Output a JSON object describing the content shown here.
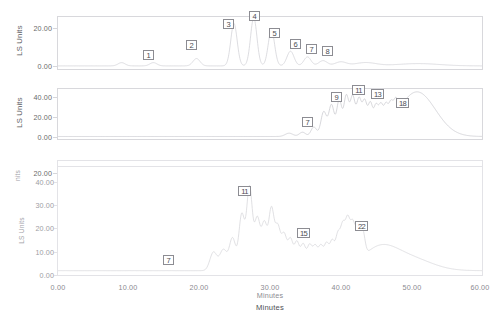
{
  "figure": {
    "axis": {
      "x_label": "Minutes",
      "x_label_lower": "Minutes",
      "x_ticks": [
        "0.00",
        "10.00",
        "20.00",
        "30.00",
        "40.00",
        "50.00",
        "60.00"
      ],
      "x_min": 0,
      "x_max": 60
    },
    "panels": [
      {
        "id": "panel-1",
        "y_label": "LS Units",
        "y_ticks": [
          "20.00",
          "0.00"
        ],
        "y_values": [
          20,
          0
        ],
        "peak_labels": [
          "1",
          "2",
          "3",
          "4",
          "5",
          "6",
          "7",
          "8"
        ]
      },
      {
        "id": "panel-2",
        "y_label": "LS Units",
        "y_ticks": [
          "40.00",
          "20.00",
          "0.00"
        ],
        "y_values": [
          40,
          20,
          0
        ],
        "peak_labels": [
          "7",
          "9",
          "11",
          "13",
          "18"
        ]
      },
      {
        "id": "panel-3",
        "y_label_top": "nits",
        "y_label": "LS Units",
        "y_ticks_top": [
          "20.00"
        ],
        "y_ticks": [
          "40.00",
          "30.00",
          "20.00",
          "10.00",
          "0.00"
        ],
        "y_values": [
          40,
          30,
          20,
          10,
          0
        ],
        "peak_labels": [
          "7",
          "11",
          "15",
          "22"
        ]
      }
    ]
  },
  "chart_data": {
    "type": "line",
    "title": "",
    "xlabel": "Minutes",
    "ylabel": "LS Units",
    "xlim": [
      0,
      60
    ],
    "grid": false,
    "legend": "none",
    "panels": [
      {
        "name": "panel-1",
        "ylabel": "LS Units",
        "ylim": [
          0,
          30
        ],
        "yticks": [
          0,
          20
        ],
        "annotations": [
          {
            "label": "1",
            "x": 13.5,
            "y": 5.5
          },
          {
            "label": "2",
            "x": 19.5,
            "y": 12.5
          },
          {
            "label": "3",
            "x": 25.0,
            "y": 25.5
          },
          {
            "label": "4",
            "x": 27.7,
            "y": 29.0
          },
          {
            "label": "5",
            "x": 30.2,
            "y": 22.5
          },
          {
            "label": "6",
            "x": 33.2,
            "y": 15.5
          },
          {
            "label": "7",
            "x": 35.4,
            "y": 13.0
          },
          {
            "label": "8",
            "x": 37.6,
            "y": 12.0
          }
        ],
        "peaks": [
          {
            "x": 9.0,
            "height": 2.0,
            "width": 0.5
          },
          {
            "x": 13.5,
            "height": 2.0,
            "width": 0.5
          },
          {
            "x": 19.6,
            "height": 4.5,
            "width": 0.5
          },
          {
            "x": 24.9,
            "height": 26.0,
            "width": 0.45
          },
          {
            "x": 27.7,
            "height": 29.5,
            "width": 0.45
          },
          {
            "x": 30.2,
            "height": 22.0,
            "width": 0.45
          },
          {
            "x": 32.9,
            "height": 9.0,
            "width": 0.5
          },
          {
            "x": 35.3,
            "height": 5.5,
            "width": 0.5
          },
          {
            "x": 37.5,
            "height": 3.2,
            "width": 0.6
          },
          {
            "x": 40.0,
            "height": 2.4,
            "width": 0.8
          },
          {
            "x": 43.5,
            "height": 2.0,
            "width": 1.5
          },
          {
            "x": 51.0,
            "height": 1.4,
            "width": 3.0
          }
        ]
      },
      {
        "name": "panel-2",
        "ylabel": "LS Units",
        "ylim": [
          0,
          50
        ],
        "yticks": [
          0,
          20,
          40
        ],
        "annotations": [
          {
            "label": "7",
            "x": 33.0,
            "y": 16.0
          },
          {
            "label": "9",
            "x": 38.6,
            "y": 41.0
          },
          {
            "label": "11",
            "x": 41.2,
            "y": 48.0
          },
          {
            "label": "13",
            "x": 43.7,
            "y": 46.0
          },
          {
            "label": "18",
            "x": 47.5,
            "y": 37.0
          }
        ],
        "peaks": [
          {
            "x": 32.7,
            "height": 3.5,
            "width": 0.55
          },
          {
            "x": 34.6,
            "height": 4.5,
            "width": 0.45
          },
          {
            "x": 36.2,
            "height": 10.0,
            "width": 0.4
          },
          {
            "x": 37.6,
            "height": 26.0,
            "width": 0.4
          },
          {
            "x": 38.7,
            "height": 33.0,
            "width": 0.38
          },
          {
            "x": 39.8,
            "height": 38.0,
            "width": 0.36
          },
          {
            "x": 40.8,
            "height": 42.0,
            "width": 0.35
          },
          {
            "x": 41.7,
            "height": 41.0,
            "width": 0.35
          },
          {
            "x": 42.6,
            "height": 38.0,
            "width": 0.34
          },
          {
            "x": 43.4,
            "height": 35.0,
            "width": 0.33
          },
          {
            "x": 44.2,
            "height": 32.0,
            "width": 0.32
          },
          {
            "x": 45.0,
            "height": 28.0,
            "width": 0.32
          },
          {
            "x": 45.7,
            "height": 25.0,
            "width": 0.3
          },
          {
            "x": 46.4,
            "height": 22.0,
            "width": 0.3
          },
          {
            "x": 47.1,
            "height": 19.0,
            "width": 0.3
          },
          {
            "x": 47.8,
            "height": 16.0,
            "width": 0.3
          },
          {
            "x": 50.8,
            "height": 47.0,
            "width": 2.6
          }
        ]
      },
      {
        "name": "panel-3",
        "ylabel": "LS Units",
        "ylim": [
          0,
          45
        ],
        "yticks": [
          0,
          10,
          20,
          30,
          40
        ],
        "annotations": [
          {
            "label": "7",
            "x": 16.5,
            "y": 7.0
          },
          {
            "label": "11",
            "x": 27.6,
            "y": 39.0
          },
          {
            "label": "15",
            "x": 34.2,
            "y": 21.0
          },
          {
            "label": "22",
            "x": 40.5,
            "y": 24.0
          }
        ],
        "peaks": [
          {
            "x": 22.0,
            "height": 8.0,
            "width": 0.5
          },
          {
            "x": 23.4,
            "height": 9.0,
            "width": 0.5
          },
          {
            "x": 24.7,
            "height": 14.0,
            "width": 0.45
          },
          {
            "x": 26.0,
            "height": 24.0,
            "width": 0.4
          },
          {
            "x": 27.1,
            "height": 36.0,
            "width": 0.4
          },
          {
            "x": 28.2,
            "height": 22.0,
            "width": 0.4
          },
          {
            "x": 29.2,
            "height": 20.0,
            "width": 0.4
          },
          {
            "x": 30.2,
            "height": 26.0,
            "width": 0.38
          },
          {
            "x": 31.1,
            "height": 18.0,
            "width": 0.38
          },
          {
            "x": 32.0,
            "height": 15.0,
            "width": 0.38
          },
          {
            "x": 32.9,
            "height": 13.0,
            "width": 0.36
          },
          {
            "x": 33.8,
            "height": 12.0,
            "width": 0.36
          },
          {
            "x": 34.7,
            "height": 11.0,
            "width": 0.36
          },
          {
            "x": 35.6,
            "height": 10.5,
            "width": 0.35
          },
          {
            "x": 36.4,
            "height": 10.0,
            "width": 0.35
          },
          {
            "x": 37.2,
            "height": 10.0,
            "width": 0.34
          },
          {
            "x": 38.0,
            "height": 11.0,
            "width": 0.34
          },
          {
            "x": 38.8,
            "height": 12.0,
            "width": 0.34
          },
          {
            "x": 39.6,
            "height": 14.0,
            "width": 0.33
          },
          {
            "x": 40.3,
            "height": 17.0,
            "width": 0.33
          },
          {
            "x": 41.0,
            "height": 19.0,
            "width": 0.33
          },
          {
            "x": 41.7,
            "height": 16.0,
            "width": 0.32
          },
          {
            "x": 42.4,
            "height": 13.0,
            "width": 0.32
          },
          {
            "x": 43.1,
            "height": 11.0,
            "width": 0.32
          },
          {
            "x": 45.5,
            "height": 9.5,
            "width": 2.5
          },
          {
            "x": 50.0,
            "height": 5.0,
            "width": 3.0
          }
        ]
      }
    ]
  }
}
